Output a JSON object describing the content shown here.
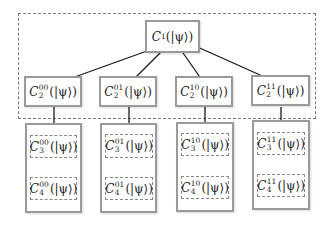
{
  "diagram": {
    "root": {
      "symbol": "C",
      "subscript": "1",
      "superscript": "",
      "arg": "(|ψ⟩)"
    },
    "level2": [
      {
        "symbol": "C",
        "subscript": "2",
        "superscript": "00",
        "arg": "(|ψ⟩)"
      },
      {
        "symbol": "C",
        "subscript": "2",
        "superscript": "01",
        "arg": "(|ψ⟩)"
      },
      {
        "symbol": "C",
        "subscript": "2",
        "superscript": "10",
        "arg": "(|ψ⟩)"
      },
      {
        "symbol": "C",
        "subscript": "2",
        "superscript": "11",
        "arg": "(|ψ⟩)"
      }
    ],
    "level3": [
      {
        "symbol": "C",
        "subscript": "3",
        "superscript": "00",
        "arg": "(|ψ⟩)"
      },
      {
        "symbol": "C",
        "subscript": "3",
        "superscript": "01",
        "arg": "(|ψ⟩)"
      },
      {
        "symbol": "C",
        "subscript": "3",
        "superscript": "10",
        "arg": "(|ψ⟩)"
      },
      {
        "symbol": "C",
        "subscript": "3",
        "superscript": "11",
        "arg": "(|ψ⟩)"
      }
    ],
    "level4": [
      {
        "symbol": "C",
        "subscript": "4",
        "superscript": "00",
        "arg": "(|ψ⟩)"
      },
      {
        "symbol": "C",
        "subscript": "4",
        "superscript": "01",
        "arg": "(|ψ⟩)"
      },
      {
        "symbol": "C",
        "subscript": "4",
        "superscript": "10",
        "arg": "(|ψ⟩)"
      },
      {
        "symbol": "C",
        "subscript": "4",
        "superscript": "11",
        "arg": "(|ψ⟩)"
      }
    ],
    "colors": {
      "box_border": "#9a9a9a",
      "dashed_border": "#7a7a7a",
      "arrow": "#1a1a1a",
      "text": "#222222"
    }
  }
}
